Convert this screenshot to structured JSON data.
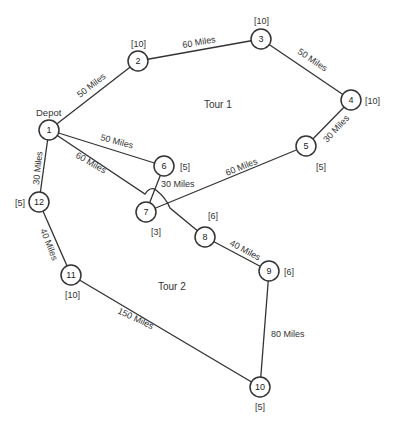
{
  "diagram": {
    "depot_label": "Depot",
    "tour_labels": [
      "Tour 1",
      "Tour 2"
    ],
    "nodes": [
      {
        "id": "1",
        "demand": ""
      },
      {
        "id": "2",
        "demand": "[10]"
      },
      {
        "id": "3",
        "demand": "[10]"
      },
      {
        "id": "4",
        "demand": "[10]"
      },
      {
        "id": "5",
        "demand": "[5]"
      },
      {
        "id": "6",
        "demand": "[5]"
      },
      {
        "id": "7",
        "demand": "[3]"
      },
      {
        "id": "8",
        "demand": "[6]"
      },
      {
        "id": "9",
        "demand": "[6]"
      },
      {
        "id": "10",
        "demand": "[5]"
      },
      {
        "id": "11",
        "demand": "[10]"
      },
      {
        "id": "12",
        "demand": "[5]"
      }
    ],
    "edges": [
      {
        "from": "1",
        "to": "2",
        "label": "50 Miles"
      },
      {
        "from": "2",
        "to": "3",
        "label": "60 Miles"
      },
      {
        "from": "3",
        "to": "4",
        "label": "50 Miles"
      },
      {
        "from": "4",
        "to": "5",
        "label": "30 Miles"
      },
      {
        "from": "5",
        "to": "7",
        "label": "60 Miles"
      },
      {
        "from": "7",
        "to": "6",
        "label": "30 Miles"
      },
      {
        "from": "6",
        "to": "1",
        "label": "50 Miles"
      },
      {
        "from": "1",
        "to": "8",
        "label": "60 Miles"
      },
      {
        "from": "8",
        "to": "9",
        "label": "40 Miles"
      },
      {
        "from": "9",
        "to": "10",
        "label": "80 Miles"
      },
      {
        "from": "10",
        "to": "11",
        "label": "150 Miles"
      },
      {
        "from": "11",
        "to": "12",
        "label": "40 Miles"
      },
      {
        "from": "12",
        "to": "1",
        "label": "30 Miles"
      }
    ]
  }
}
